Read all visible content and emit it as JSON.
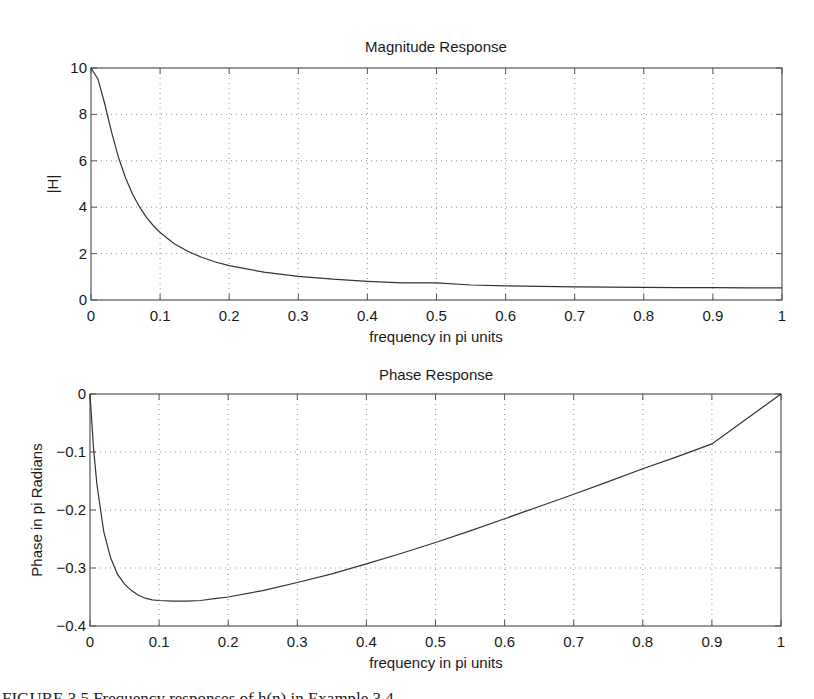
{
  "figure": {
    "caption": "FIGURE 3.5  Frequency responses of h(n) in Example 3.4"
  },
  "chart_data": [
    {
      "type": "line",
      "title": "Magnitude Response",
      "xlabel": "frequency in pi units",
      "ylabel": "|H|",
      "xlim": [
        0,
        1
      ],
      "ylim": [
        0,
        10
      ],
      "grid": true,
      "xticks": [
        "0",
        "0.1",
        "0.2",
        "0.3",
        "0.4",
        "0.5",
        "0.6",
        "0.7",
        "0.8",
        "0.9",
        "1"
      ],
      "yticks": [
        "0",
        "2",
        "4",
        "6",
        "8",
        "10"
      ],
      "x": [
        0,
        0.01,
        0.02,
        0.03,
        0.04,
        0.05,
        0.06,
        0.07,
        0.08,
        0.09,
        0.1,
        0.12,
        0.14,
        0.16,
        0.18,
        0.2,
        0.25,
        0.3,
        0.35,
        0.4,
        0.45,
        0.5,
        0.55,
        0.6,
        0.65,
        0.7,
        0.75,
        0.8,
        0.85,
        0.9,
        0.95,
        1.0
      ],
      "values": [
        10.0,
        9.53,
        8.45,
        7.21,
        6.13,
        5.26,
        4.57,
        4.02,
        3.57,
        3.21,
        2.91,
        2.44,
        2.1,
        1.84,
        1.64,
        1.48,
        1.2,
        1.02,
        0.898,
        0.806,
        0.737,
        0.743,
        0.645,
        0.614,
        0.589,
        0.57,
        0.554,
        0.543,
        0.534,
        0.529,
        0.527,
        0.526
      ],
      "series": [
        {
          "name": "|H|"
        }
      ]
    },
    {
      "type": "line",
      "title": "Phase Response",
      "xlabel": "frequency in pi units",
      "ylabel": "Phase in pi Radians",
      "xlim": [
        0,
        1
      ],
      "ylim": [
        -0.4,
        0
      ],
      "grid": true,
      "xticks": [
        "0",
        "0.1",
        "0.2",
        "0.3",
        "0.4",
        "0.5",
        "0.6",
        "0.7",
        "0.8",
        "0.9",
        "1"
      ],
      "yticks": [
        "-0.4",
        "-0.3",
        "-0.2",
        "-0.1",
        "0"
      ],
      "x": [
        0,
        0.005,
        0.01,
        0.02,
        0.03,
        0.04,
        0.05,
        0.06,
        0.07,
        0.08,
        0.09,
        0.1,
        0.12,
        0.14,
        0.16,
        0.18,
        0.2,
        0.25,
        0.3,
        0.35,
        0.4,
        0.45,
        0.5,
        0.55,
        0.6,
        0.65,
        0.7,
        0.75,
        0.8,
        0.85,
        0.9,
        0.95,
        1.0
      ],
      "values": [
        0,
        -0.093,
        -0.156,
        -0.238,
        -0.283,
        -0.311,
        -0.328,
        -0.339,
        -0.347,
        -0.352,
        -0.355,
        -0.356,
        -0.357,
        -0.357,
        -0.356,
        -0.353,
        -0.35,
        -0.339,
        -0.325,
        -0.31,
        -0.293,
        -0.275,
        -0.256,
        -0.236,
        -0.215,
        -0.194,
        -0.173,
        -0.151,
        -0.129,
        -0.108,
        -0.086,
        -0.043,
        0
      ],
      "series": [
        {
          "name": "phase"
        }
      ]
    }
  ]
}
